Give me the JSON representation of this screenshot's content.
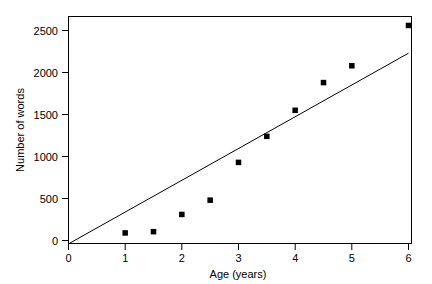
{
  "chart_data": {
    "type": "scatter",
    "title": "",
    "xlabel": "Age (years)",
    "ylabel": "Number of words",
    "xlim": [
      0,
      6
    ],
    "ylim": [
      0,
      2600
    ],
    "xticks": [
      0,
      1,
      2,
      3,
      4,
      5,
      6
    ],
    "xticklabels": [
      "0",
      "1",
      "2",
      "3",
      "4",
      "5",
      "6"
    ],
    "yticks": [
      0,
      500,
      1000,
      1500,
      2000,
      2500
    ],
    "yticklabels": [
      "0",
      "500",
      "1000",
      "1500",
      "2000",
      "2500"
    ],
    "grid": false,
    "legend": null,
    "marker": "square",
    "marker_color": "#000000",
    "x": [
      1,
      1.5,
      2,
      2.5,
      3,
      3.5,
      4,
      4.5,
      5,
      6
    ],
    "y": [
      90,
      105,
      310,
      480,
      930,
      1240,
      1550,
      1880,
      2080,
      2560
    ],
    "series": [
      {
        "name": "Vocabulary size",
        "type": "scatter",
        "x": [
          1,
          1.5,
          2,
          2.5,
          3,
          3.5,
          4,
          4.5,
          5,
          6
        ],
        "values": [
          90,
          105,
          310,
          480,
          930,
          1240,
          1550,
          1880,
          2080,
          2560
        ]
      },
      {
        "name": "Linear fit",
        "type": "line",
        "x": [
          0,
          6
        ],
        "values": [
          -40,
          2230
        ]
      }
    ],
    "annotations": []
  },
  "axes": {
    "x_axis_title": "Age (years)",
    "y_axis_title": "Number of words"
  }
}
